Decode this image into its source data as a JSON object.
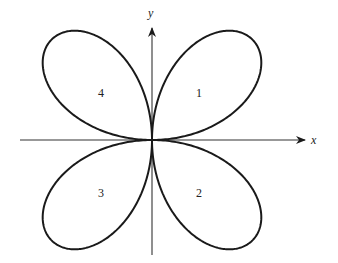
{
  "diagram": {
    "type": "polar four-leaved rose",
    "axes": {
      "x_label": "x",
      "y_label": "y"
    },
    "petals": [
      {
        "label": "1",
        "quadrant": "upper-right"
      },
      {
        "label": "2",
        "quadrant": "lower-right"
      },
      {
        "label": "3",
        "quadrant": "lower-left"
      },
      {
        "label": "4",
        "quadrant": "upper-left"
      }
    ],
    "colors": {
      "stroke": "#1a1a1a",
      "background": "#ffffff"
    }
  }
}
